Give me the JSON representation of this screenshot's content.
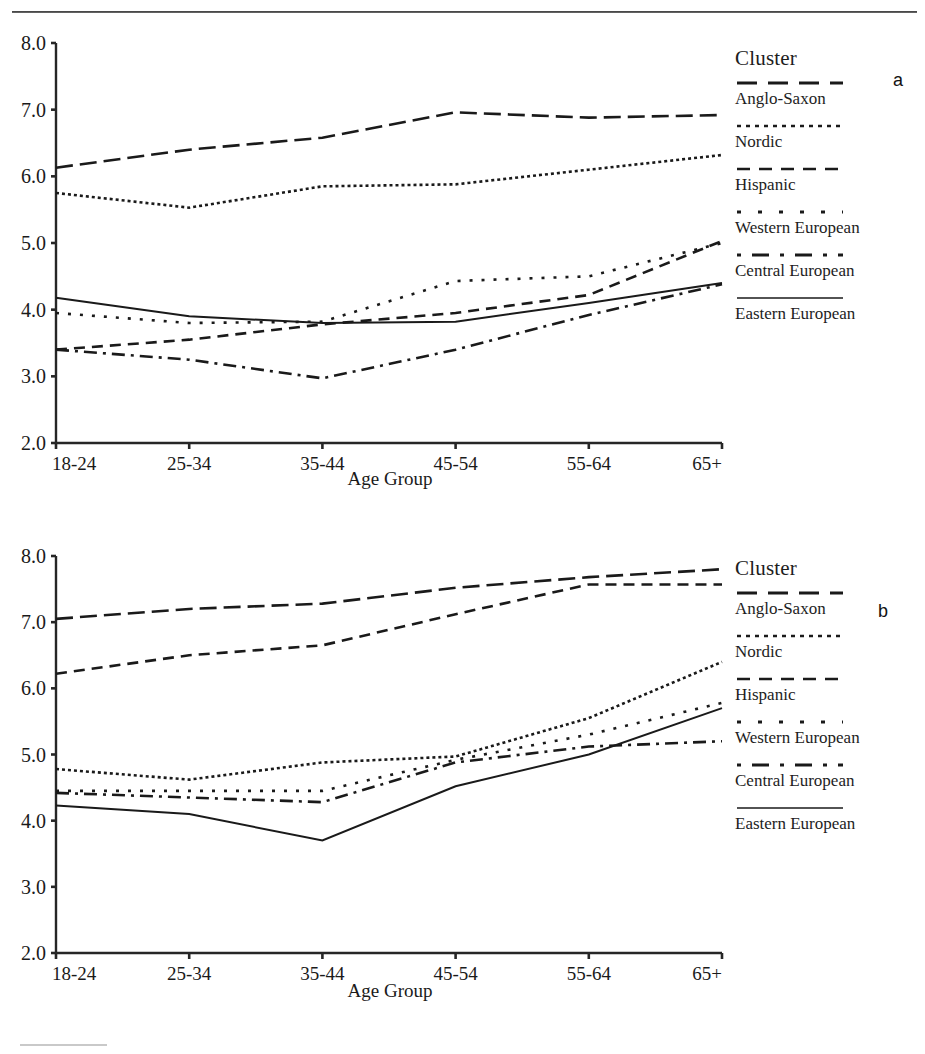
{
  "page": {
    "background": "#ffffff",
    "ink": "#1a1a1a",
    "top_rule": true,
    "bottom_rule": true
  },
  "legend": {
    "title": "Cluster",
    "entries": [
      {
        "label": "Anglo-Saxon",
        "style": "long-dash"
      },
      {
        "label": "Nordic",
        "style": "fine-dotted"
      },
      {
        "label": "Hispanic",
        "style": "dashed"
      },
      {
        "label": "Western European",
        "style": "sparse-dotted"
      },
      {
        "label": "Central European",
        "style": "dash-dot"
      },
      {
        "label": "Eastern European",
        "style": "solid"
      }
    ]
  },
  "panels": [
    {
      "letter": "a"
    },
    {
      "letter": "b"
    }
  ],
  "chart_data": [
    {
      "id": "panel-a",
      "panel_letter": "a",
      "type": "line",
      "title": "",
      "xlabel": "Age Group",
      "ylabel": "",
      "categories": [
        "18-24",
        "25-34",
        "35-44",
        "45-54",
        "55-64",
        "65+"
      ],
      "ylim": [
        2.0,
        8.0
      ],
      "yticks": [
        "2.0",
        "3.0",
        "4.0",
        "5.0",
        "6.0",
        "7.0",
        "8.0"
      ],
      "grid": false,
      "legend_position": "right",
      "series": [
        {
          "name": "Anglo-Saxon",
          "style": "long-dash",
          "values": [
            6.13,
            6.4,
            6.58,
            6.96,
            6.88,
            6.92
          ]
        },
        {
          "name": "Nordic",
          "style": "fine-dotted",
          "values": [
            5.75,
            5.53,
            5.85,
            5.88,
            6.1,
            6.32
          ]
        },
        {
          "name": "Hispanic",
          "style": "dashed",
          "values": [
            3.4,
            3.55,
            3.78,
            3.95,
            4.22,
            5.03
          ]
        },
        {
          "name": "Western European",
          "style": "sparse-dotted",
          "values": [
            3.95,
            3.8,
            3.82,
            4.43,
            4.5,
            5.0
          ]
        },
        {
          "name": "Central European",
          "style": "dash-dot",
          "values": [
            3.4,
            3.25,
            2.97,
            3.4,
            3.92,
            4.38
          ]
        },
        {
          "name": "Eastern European",
          "style": "solid",
          "values": [
            4.18,
            3.9,
            3.8,
            3.82,
            4.1,
            4.4
          ]
        }
      ]
    },
    {
      "id": "panel-b",
      "panel_letter": "b",
      "type": "line",
      "title": "",
      "xlabel": "Age Group",
      "ylabel": "",
      "categories": [
        "18-24",
        "25-34",
        "35-44",
        "45-54",
        "55-64",
        "65+"
      ],
      "ylim": [
        2.0,
        8.0
      ],
      "yticks": [
        "2.0",
        "3.0",
        "4.0",
        "5.0",
        "6.0",
        "7.0",
        "8.0"
      ],
      "grid": false,
      "legend_position": "right",
      "series": [
        {
          "name": "Anglo-Saxon",
          "style": "long-dash",
          "values": [
            7.05,
            7.2,
            7.28,
            7.52,
            7.68,
            7.8
          ]
        },
        {
          "name": "Nordic",
          "style": "fine-dotted",
          "values": [
            4.78,
            4.62,
            4.88,
            4.97,
            5.55,
            6.4
          ]
        },
        {
          "name": "Hispanic",
          "style": "dashed",
          "values": [
            6.22,
            6.5,
            6.65,
            7.12,
            7.57,
            7.57
          ]
        },
        {
          "name": "Western European",
          "style": "sparse-dotted",
          "values": [
            4.45,
            4.45,
            4.45,
            4.92,
            5.3,
            5.78
          ]
        },
        {
          "name": "Central European",
          "style": "dash-dot",
          "values": [
            4.42,
            4.35,
            4.28,
            4.88,
            5.12,
            5.2
          ]
        },
        {
          "name": "Eastern European",
          "style": "solid",
          "values": [
            4.23,
            4.1,
            3.7,
            4.52,
            5.0,
            5.7
          ]
        }
      ]
    }
  ]
}
